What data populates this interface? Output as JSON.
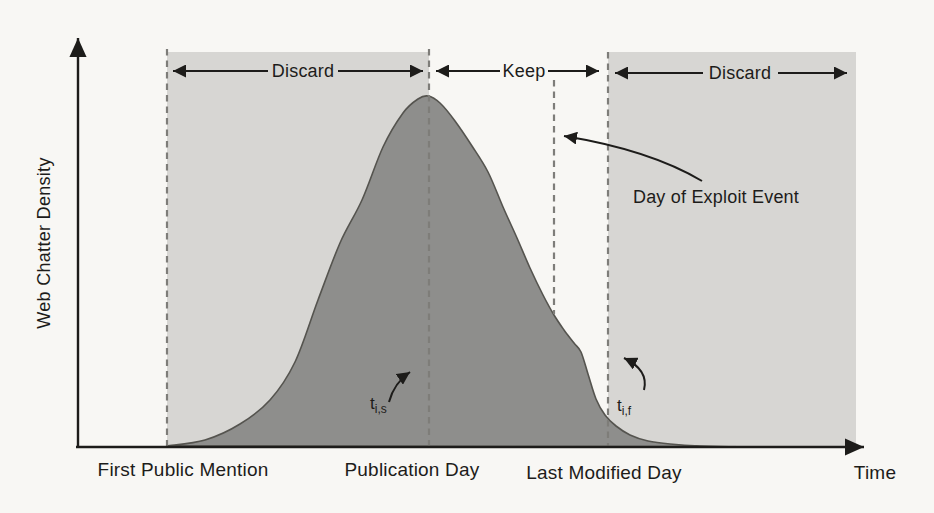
{
  "figure": {
    "y_axis_label": "Web Chatter Density",
    "x_axis_label": "Time",
    "region_labels": {
      "discard_left": "Discard",
      "keep": "Keep",
      "discard_right": "Discard"
    },
    "x_event_labels": {
      "first_public_mention": "First Public Mention",
      "publication_day": "Publication Day",
      "last_modified_day": "Last Modified Day"
    },
    "annotations": {
      "exploit_event": "Day of Exploit Event",
      "t_start": {
        "base": "t",
        "sub": "i,s"
      },
      "t_finish": {
        "base": "t",
        "sub": "i,f"
      }
    },
    "colors": {
      "page-bg": "#f8f7f4",
      "region-shade": "#d7d6d3",
      "curve-fill": "#8e8e8c",
      "curve-stroke": "#55544f",
      "dash-color": "#7e7d79",
      "ink": "#1d1c1a"
    },
    "curve_points": [
      [
        167,
        446
      ],
      [
        205,
        440
      ],
      [
        240,
        424
      ],
      [
        270,
        400
      ],
      [
        295,
        362
      ],
      [
        318,
        300
      ],
      [
        340,
        243
      ],
      [
        362,
        200
      ],
      [
        383,
        147
      ],
      [
        403,
        113
      ],
      [
        418,
        99
      ],
      [
        428,
        96
      ],
      [
        440,
        103
      ],
      [
        455,
        121
      ],
      [
        472,
        146
      ],
      [
        488,
        172
      ],
      [
        503,
        207
      ],
      [
        517,
        238
      ],
      [
        530,
        268
      ],
      [
        543,
        295
      ],
      [
        554,
        315
      ],
      [
        564,
        330
      ],
      [
        574,
        343
      ],
      [
        581,
        352
      ],
      [
        588,
        374
      ],
      [
        596,
        399
      ],
      [
        605,
        415
      ],
      [
        616,
        426
      ],
      [
        630,
        435
      ],
      [
        648,
        441
      ],
      [
        670,
        444
      ],
      [
        700,
        446
      ],
      [
        740,
        447
      ],
      [
        800,
        447
      ],
      [
        856,
        447
      ]
    ]
  }
}
